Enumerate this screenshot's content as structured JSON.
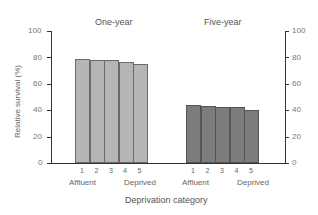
{
  "chart_data": {
    "type": "bar",
    "title": "",
    "panels": [
      {
        "title": "One-year",
        "categories": [
          "1",
          "2",
          "3",
          "4",
          "5"
        ],
        "values": [
          79,
          78,
          78,
          76.5,
          75
        ],
        "color": "#b5b5b5"
      },
      {
        "title": "Five-year",
        "categories": [
          "1",
          "2",
          "3",
          "4",
          "5"
        ],
        "values": [
          44,
          43,
          42.5,
          42.5,
          40.5
        ],
        "color": "#7c7c7c"
      }
    ],
    "series": [
      {
        "name": "One-year",
        "values": [
          79,
          78,
          78,
          76.5,
          75
        ]
      },
      {
        "name": "Five-year",
        "values": [
          44,
          43,
          42.5,
          42.5,
          40.5
        ]
      }
    ],
    "categories": [
      "1",
      "2",
      "3",
      "4",
      "5"
    ],
    "category_end_labels": {
      "low": "Affluent",
      "high": "Deprived"
    },
    "xlabel": "Deprivation category",
    "ylabel": "Relative survival (%)",
    "ylim": [
      0,
      100
    ],
    "yticks": [
      0,
      20,
      40,
      60,
      80,
      100
    ],
    "grid": false,
    "legend": "none"
  },
  "labels": {
    "one_year": "One-year",
    "five_year": "Five-year",
    "affluent": "Affluent",
    "deprived": "Deprived",
    "xlabel": "Deprivation category",
    "ylabel": "Relative survival (%)",
    "ticks": [
      "0",
      "20",
      "40",
      "60",
      "80",
      "100"
    ],
    "cats": [
      "1",
      "2",
      "3",
      "4",
      "5"
    ]
  }
}
